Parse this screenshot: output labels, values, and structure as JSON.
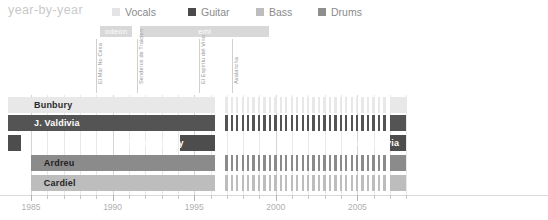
{
  "header": {
    "title": "year-by-year",
    "title_color": "#c9c9c9"
  },
  "legend": {
    "items": [
      {
        "label": "Vocals",
        "color": "#e4e4e4",
        "x": 0
      },
      {
        "label": "Guitar",
        "color": "#4a4a4a",
        "x": 76
      },
      {
        "label": "Bass",
        "color": "#bdbdbd",
        "x": 144
      },
      {
        "label": "Drums",
        "color": "#8e8e8e",
        "x": 206
      }
    ]
  },
  "labels_band": {
    "record_labels": [
      {
        "name": "odeon",
        "start_year": 1989.25,
        "end_year": 1991.2
      },
      {
        "name": "emi",
        "start_year": 1991.7,
        "end_year": 1999.6
      }
    ],
    "albums": [
      {
        "title": "El Mar No Cesa",
        "year": 1989.0
      },
      {
        "title": "Senderos de Traicion",
        "year": 1991.5
      },
      {
        "title": "El Espiritu del Vino",
        "year": 1995.3
      },
      {
        "title": "Avalancha",
        "year": 1997.3
      }
    ]
  },
  "chart_data": {
    "type": "bar",
    "title": "year-by-year",
    "xlabel": "",
    "ylabel": "",
    "xlim": [
      1985,
      2008
    ],
    "grid": true,
    "legend_position": "top",
    "x_ticks": [
      1985,
      1990,
      1995,
      2000,
      2005
    ],
    "x_tick_labels": [
      "1985",
      "1990",
      "1995",
      "2000",
      "2005"
    ],
    "rows": [
      {
        "name": "Bunbury",
        "role": "Vocals",
        "color": "#e8e8e8",
        "label_color": "#2b2b2b",
        "label_x_year": 1985.0,
        "segments": [
          {
            "start": 1983.6,
            "end": 1996.3,
            "style": "solid"
          },
          {
            "start": 1996.9,
            "end": 2006.9,
            "style": "dashed"
          },
          {
            "start": 2007.0,
            "end": 2008.0,
            "style": "solid"
          }
        ]
      },
      {
        "name": "J. Valdivia",
        "role": "Guitar",
        "color": "#545454",
        "label_color": "#ffffff",
        "label_x_year": 1985.0,
        "segments": [
          {
            "start": 1983.6,
            "end": 1996.3,
            "style": "solid"
          },
          {
            "start": 1996.9,
            "end": 2006.9,
            "style": "dashed"
          },
          {
            "start": 2007.0,
            "end": 2008.0,
            "style": "solid"
          }
        ]
      },
      {
        "name": "Boguslavsky",
        "role": "Bass",
        "color": "#4d4d4d",
        "label_color": "#ffffff",
        "label_x_year": 1994.6,
        "label_align": "right",
        "segments": [
          {
            "start": 1983.6,
            "end": 1984.4,
            "style": "solid"
          },
          {
            "start": 1994.1,
            "end": 1996.3,
            "style": "solid"
          }
        ]
      },
      {
        "name": "G. Valdivia",
        "role": "Bass",
        "color": "#4d4d4d",
        "label_color": "#ffffff",
        "label_x_year": 2007.8,
        "label_align": "right",
        "row_index": 2,
        "segments": [
          {
            "start": 2007.0,
            "end": 2008.0,
            "style": "solid"
          }
        ]
      },
      {
        "name": "Ardreu",
        "role": "Drums",
        "color": "#8b8b8b",
        "label_color": "#1f1f1f",
        "label_x_year": 1985.6,
        "segments": [
          {
            "start": 1985.0,
            "end": 1996.3,
            "style": "solid"
          },
          {
            "start": 1996.9,
            "end": 2006.9,
            "style": "dashed"
          },
          {
            "start": 2007.0,
            "end": 2008.0,
            "style": "solid"
          }
        ]
      },
      {
        "name": "Cardiel",
        "role": "Bass",
        "color": "#bdbdbd",
        "label_color": "#1f1f1f",
        "label_x_year": 1985.6,
        "segments": [
          {
            "start": 1985.0,
            "end": 1996.3,
            "style": "solid"
          },
          {
            "start": 1996.9,
            "end": 2006.9,
            "style": "dashed"
          },
          {
            "start": 2007.0,
            "end": 2008.0,
            "style": "solid"
          }
        ]
      }
    ]
  }
}
